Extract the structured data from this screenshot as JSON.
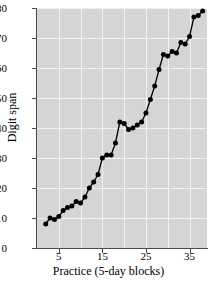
{
  "chart_data": {
    "type": "line",
    "title": "",
    "xlabel": "Practice (5-day blocks)",
    "ylabel": "Digit span",
    "xlim": [
      0,
      39
    ],
    "ylim": [
      0,
      80
    ],
    "xticks": [
      5,
      15,
      25,
      35
    ],
    "yticks": [
      0,
      10,
      20,
      30,
      40,
      50,
      60,
      70,
      80
    ],
    "grid": true,
    "legend": null,
    "marker": "filled-circle",
    "series": [
      {
        "name": "Digit span",
        "x": [
          2,
          3,
          4,
          5,
          6,
          7,
          8,
          9,
          10,
          11,
          12,
          13,
          14,
          15,
          16,
          17,
          18,
          19,
          20,
          21,
          22,
          23,
          24,
          25,
          26,
          27,
          28,
          29,
          30,
          31,
          32,
          33,
          34,
          35,
          36,
          37,
          38
        ],
        "values": [
          8,
          10,
          9.5,
          10.5,
          12.5,
          13.5,
          14,
          15.5,
          15,
          17,
          20,
          22,
          24.5,
          30,
          31,
          31,
          35,
          42,
          41.5,
          39.5,
          40,
          41,
          42,
          45,
          49.5,
          54,
          59.5,
          64.5,
          64,
          65.5,
          65,
          68.5,
          68,
          70.5,
          77,
          77.5,
          79
        ]
      }
    ]
  },
  "axis": {
    "y_tick_labels": [
      "0",
      "10",
      "20",
      "30",
      "40",
      "50",
      "60",
      "70",
      "80"
    ],
    "x_tick_labels": [
      "5",
      "15",
      "25",
      "35"
    ],
    "y_title": "Digit span",
    "x_title": "Practice (5-day blocks)"
  },
  "colors": {
    "plot_background": "#d5d5d5",
    "gridline": "#f2f2f2",
    "axis": "#4a4a4a",
    "series": "#000000",
    "page_background": "#ffffff",
    "text": "#000000"
  }
}
